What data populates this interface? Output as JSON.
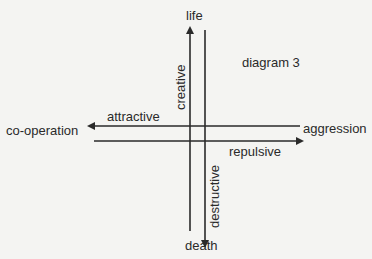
{
  "diagram": {
    "title": "diagram 3",
    "axes": {
      "top": "life",
      "bottom": "death",
      "left": "co-operation",
      "right": "aggression"
    },
    "arrow_labels": {
      "up": "creative",
      "down": "destructive",
      "left": "attractive",
      "right": "repulsive"
    },
    "line_color": "#2a2a2a",
    "background": "#f4f4f2"
  }
}
